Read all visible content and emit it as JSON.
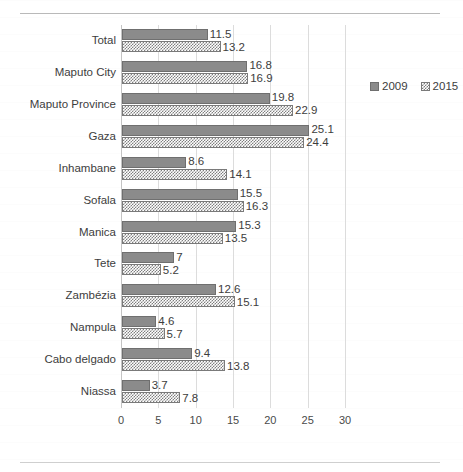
{
  "chart_data": {
    "type": "bar",
    "orientation": "horizontal",
    "title": "",
    "xlabel": "",
    "ylabel": "",
    "xlim": [
      0,
      30
    ],
    "xticks": [
      0,
      5,
      10,
      15,
      20,
      25,
      30
    ],
    "xtick_labels": [
      "0",
      "5",
      "10",
      "15",
      "20",
      "25",
      "30"
    ],
    "grid": true,
    "grid_axis": "x",
    "legend_position": "right-top",
    "categories": [
      "Total",
      "Maputo City",
      "Maputo Province",
      "Gaza",
      "Inhambane",
      "Sofala",
      "Manica",
      "Tete",
      "Zambézia",
      "Nampula",
      "Cabo delgado",
      "Niassa"
    ],
    "series": [
      {
        "name": "2009",
        "color": "#8b8b8b",
        "pattern": "solid",
        "values": [
          11.5,
          16.8,
          19.8,
          25.1,
          8.6,
          15.5,
          15.3,
          7,
          12.6,
          4.6,
          9.4,
          3.7
        ],
        "labels": [
          "11.5",
          "16.8",
          "19.8",
          "25.1",
          "8.6",
          "15.5",
          "15.3",
          "7",
          "12.6",
          "4.6",
          "9.4",
          "3.7"
        ]
      },
      {
        "name": "2015",
        "color": "#7f7f7f",
        "pattern": "checker",
        "values": [
          13.2,
          16.9,
          22.9,
          24.4,
          14.1,
          16.3,
          13.5,
          5.2,
          15.1,
          5.7,
          13.8,
          7.8
        ],
        "labels": [
          "13.2",
          "16.9",
          "22.9",
          "24.4",
          "14.1",
          "16.3",
          "13.5",
          "5.2",
          "15.1",
          "5.7",
          "13.8",
          "7.8"
        ]
      }
    ]
  },
  "legend": {
    "items": [
      {
        "label": "2009",
        "swatch": "solid-square-gray"
      },
      {
        "label": "2015",
        "swatch": "checker-square-gray"
      }
    ]
  }
}
